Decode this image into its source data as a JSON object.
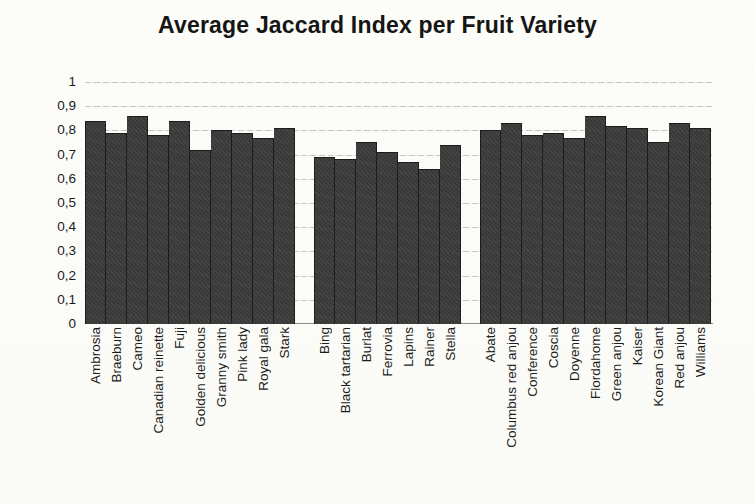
{
  "chart_data": {
    "type": "bar",
    "title": "Average Jaccard Index per Fruit Variety",
    "xlabel": "",
    "ylabel": "",
    "ylim": [
      0,
      1
    ],
    "grid": true,
    "legend": false,
    "bar_color": "#3d3d3d",
    "gridline_color": "#c7c7c0",
    "background_color": "#fcfcf9",
    "yticks": [
      {
        "label": "1",
        "value": 1.0
      },
      {
        "label": "0,9",
        "value": 0.9
      },
      {
        "label": "0,8",
        "value": 0.8
      },
      {
        "label": "0,7",
        "value": 0.7
      },
      {
        "label": "0,6",
        "value": 0.6
      },
      {
        "label": "0,5",
        "value": 0.5
      },
      {
        "label": "0,4",
        "value": 0.4
      },
      {
        "label": "0,3",
        "value": 0.3
      },
      {
        "label": "0,2",
        "value": 0.2
      },
      {
        "label": "0,1",
        "value": 0.1
      },
      {
        "label": "0",
        "value": 0.0
      }
    ],
    "groups": [
      {
        "categories": [
          "Ambrosia",
          "Braeburn",
          "Cameo",
          "Canadian reinette",
          "Fuji",
          "Golden delicious",
          "Granny smith",
          "Pink lady",
          "Royal gala",
          "Stark"
        ],
        "values": [
          0.84,
          0.79,
          0.86,
          0.78,
          0.84,
          0.72,
          0.8,
          0.79,
          0.77,
          0.81
        ]
      },
      {
        "categories": [
          "Bing",
          "Black tartarian",
          "Burlat",
          "Ferrovia",
          "Lapins",
          "Rainer",
          "Stella"
        ],
        "values": [
          0.69,
          0.68,
          0.75,
          0.71,
          0.67,
          0.64,
          0.74
        ]
      },
      {
        "categories": [
          "Abate",
          "Columbus red anjou",
          "Conference",
          "Coscia",
          "Doyenne",
          "Flordahome",
          "Green anjou",
          "Kaiser",
          "Korean Giant",
          "Red anjou",
          "Williams"
        ],
        "values": [
          0.8,
          0.83,
          0.78,
          0.79,
          0.77,
          0.86,
          0.82,
          0.81,
          0.75,
          0.83,
          0.81
        ]
      }
    ]
  }
}
